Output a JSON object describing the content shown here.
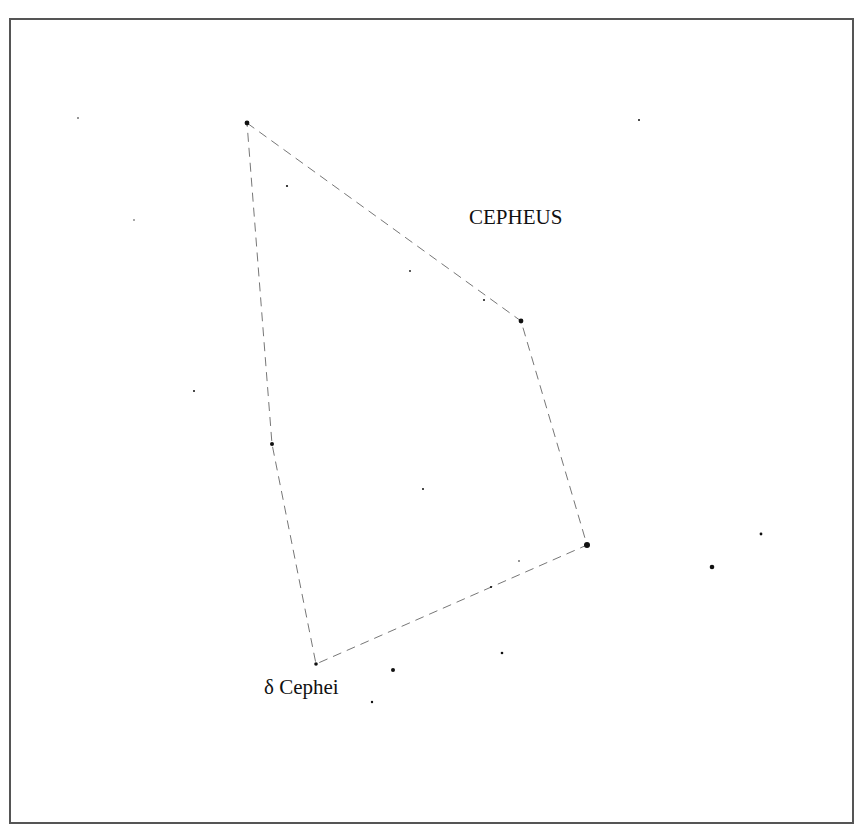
{
  "title": "CEPHEUS",
  "highlight_label": "δ Cephei",
  "colors": {
    "background": "#ffffff",
    "frame": "#555555",
    "star": "#111111",
    "line": "#777777",
    "text": "#111111"
  },
  "frame": {
    "x": 10,
    "y": 19,
    "width": 843,
    "height": 804
  },
  "title_pos": {
    "x": 469,
    "y": 224,
    "size": 21
  },
  "highlight_label_pos": {
    "x": 264,
    "y": 694,
    "size": 21
  },
  "constellation_stars": [
    {
      "x": 247,
      "y": 123,
      "r": 2.4
    },
    {
      "x": 521,
      "y": 321,
      "r": 2.4
    },
    {
      "x": 587,
      "y": 545,
      "r": 3.0
    },
    {
      "x": 316,
      "y": 664,
      "r": 1.8,
      "name": "δ Cephei"
    },
    {
      "x": 272,
      "y": 444,
      "r": 2.0
    }
  ],
  "outline_path": [
    [
      247,
      123
    ],
    [
      521,
      321
    ],
    [
      587,
      545
    ],
    [
      316,
      664
    ],
    [
      272,
      444
    ],
    [
      247,
      123
    ]
  ],
  "background_stars": [
    {
      "x": 78,
      "y": 118,
      "r": 0.8
    },
    {
      "x": 134,
      "y": 220,
      "r": 0.7
    },
    {
      "x": 287,
      "y": 186,
      "r": 1.1
    },
    {
      "x": 410,
      "y": 271,
      "r": 0.9
    },
    {
      "x": 484,
      "y": 300,
      "r": 1.0
    },
    {
      "x": 639,
      "y": 120,
      "r": 1.0
    },
    {
      "x": 194,
      "y": 391,
      "r": 1.0
    },
    {
      "x": 423,
      "y": 489,
      "r": 1.0
    },
    {
      "x": 519,
      "y": 561,
      "r": 0.8
    },
    {
      "x": 491,
      "y": 587,
      "r": 1.1
    },
    {
      "x": 502,
      "y": 653,
      "r": 1.3
    },
    {
      "x": 393,
      "y": 670,
      "r": 2.0
    },
    {
      "x": 372,
      "y": 702,
      "r": 1.2
    },
    {
      "x": 712,
      "y": 567,
      "r": 2.3
    },
    {
      "x": 761,
      "y": 534,
      "r": 1.4
    }
  ]
}
